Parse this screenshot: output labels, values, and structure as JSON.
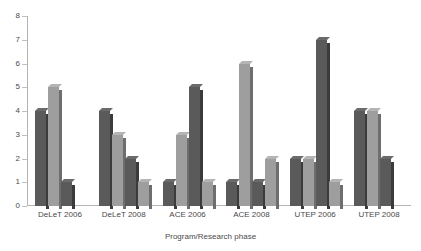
{
  "chart_data": {
    "type": "bar",
    "title": "",
    "xlabel": "Program/Research phase",
    "ylabel": "",
    "ylim": [
      0,
      8
    ],
    "yticks": [
      0,
      1,
      2,
      3,
      4,
      5,
      6,
      7,
      8
    ],
    "grid": false,
    "legend": "none",
    "categories": [
      "DeLeT 2006",
      "DeLeT 2008",
      "ACE 2006",
      "ACE 2008",
      "UTEP 2006",
      "UTEP 2008"
    ],
    "series": [
      {
        "name": "Series 1",
        "color": "#5a5a5a",
        "values": [
          4,
          4,
          1,
          1,
          2,
          4
        ]
      },
      {
        "name": "Series 2",
        "color": "#9e9e9e",
        "values": [
          5,
          3,
          3,
          6,
          2,
          4
        ]
      },
      {
        "name": "Series 3",
        "color": "#5a5a5a",
        "values": [
          1,
          2,
          5,
          1,
          7,
          2
        ]
      },
      {
        "name": "Series 4",
        "color": "#9e9e9e",
        "values": [
          0,
          1,
          1,
          2,
          1,
          0
        ]
      }
    ],
    "bars": [
      {
        "group": "DeLeT 2006",
        "bars": [
          {
            "series": "Series 1",
            "value": 4,
            "style": "series-a"
          },
          {
            "series": "Series 2",
            "value": 5,
            "style": "series-b"
          },
          {
            "series": "Series 3",
            "value": 1,
            "style": "series-a"
          },
          {
            "series": "Series 4",
            "value": 0,
            "style": "series-b"
          }
        ]
      },
      {
        "group": "DeLeT 2008",
        "bars": [
          {
            "series": "Series 1",
            "value": 4,
            "style": "series-a"
          },
          {
            "series": "Series 2",
            "value": 3,
            "style": "series-b"
          },
          {
            "series": "Series 3",
            "value": 2,
            "style": "series-a"
          },
          {
            "series": "Series 4",
            "value": 1,
            "style": "series-b"
          }
        ]
      },
      {
        "group": "ACE 2006",
        "bars": [
          {
            "series": "Series 1",
            "value": 1,
            "style": "series-a"
          },
          {
            "series": "Series 2",
            "value": 3,
            "style": "series-b"
          },
          {
            "series": "Series 3",
            "value": 5,
            "style": "series-a"
          },
          {
            "series": "Series 4",
            "value": 1,
            "style": "series-b"
          }
        ]
      },
      {
        "group": "ACE 2008",
        "bars": [
          {
            "series": "Series 1",
            "value": 1,
            "style": "series-a"
          },
          {
            "series": "Series 2",
            "value": 6,
            "style": "series-b"
          },
          {
            "series": "Series 3",
            "value": 1,
            "style": "series-a"
          },
          {
            "series": "Series 4",
            "value": 2,
            "style": "series-b"
          }
        ]
      },
      {
        "group": "UTEP 2006",
        "bars": [
          {
            "series": "Series 1",
            "value": 2,
            "style": "series-a"
          },
          {
            "series": "Series 2",
            "value": 2,
            "style": "series-b"
          },
          {
            "series": "Series 3",
            "value": 7,
            "style": "series-a"
          },
          {
            "series": "Series 4",
            "value": 1,
            "style": "series-b"
          }
        ]
      },
      {
        "group": "UTEP 2008",
        "bars": [
          {
            "series": "Series 1",
            "value": 4,
            "style": "series-a"
          },
          {
            "series": "Series 2",
            "value": 4,
            "style": "series-b"
          },
          {
            "series": "Series 3",
            "value": 2,
            "style": "series-a"
          },
          {
            "series": "Series 4",
            "value": 0,
            "style": "series-b"
          }
        ]
      }
    ],
    "colors": {
      "series_dark": "#5a5a5a",
      "series_light": "#9e9e9e",
      "axis": "#b4b4b4",
      "text": "#4a4a4a",
      "background": "#ffffff"
    }
  }
}
